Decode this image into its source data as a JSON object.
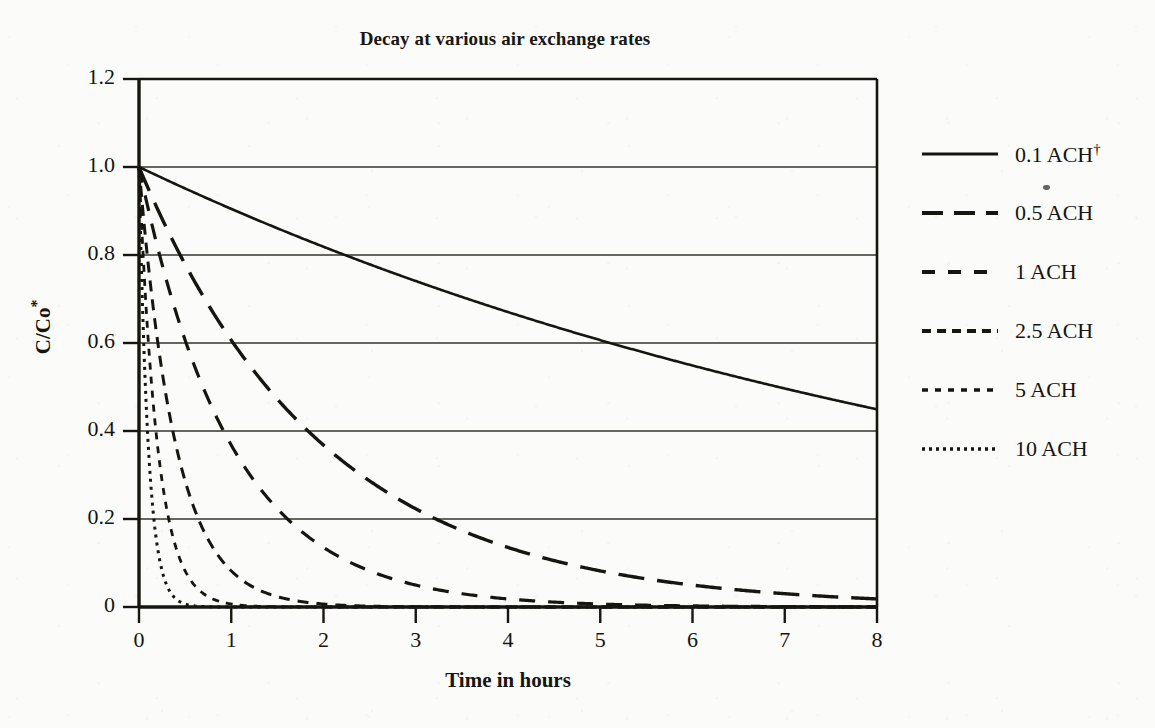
{
  "title": "Decay at various air exchange rates",
  "axes": {
    "y_title": "C/Co",
    "y_title_sup": "*",
    "x_title": "Time in hours",
    "y_ticks": [
      "1.2",
      "1.0",
      "0.8",
      "0.6",
      "0.4",
      "0.2",
      "0"
    ],
    "x_ticks": [
      "0",
      "1",
      "2",
      "3",
      "4",
      "5",
      "6",
      "7",
      "8"
    ]
  },
  "legend": {
    "items": [
      {
        "label": "0.1 ACH",
        "sup": "†",
        "dash": "none"
      },
      {
        "label": "0.5 ACH",
        "sup": "",
        "dash": "long"
      },
      {
        "label": "1 ACH",
        "sup": "",
        "dash": "medium"
      },
      {
        "label": "2.5 ACH",
        "sup": "",
        "dash": "short"
      },
      {
        "label": "5 ACH",
        "sup": "",
        "dash": "fine"
      },
      {
        "label": "10 ACH",
        "sup": "",
        "dash": "dotted"
      }
    ]
  },
  "chart_data": {
    "type": "line",
    "title": "Decay at various air exchange rates",
    "xlabel": "Time in hours",
    "ylabel": "C/Co*",
    "xlim": [
      0,
      8
    ],
    "ylim": [
      0,
      1.2
    ],
    "xticks": [
      0,
      1,
      2,
      3,
      4,
      5,
      6,
      7,
      8
    ],
    "yticks": [
      0,
      0.2,
      0.4,
      0.6,
      0.8,
      1.0,
      1.2
    ],
    "grid": "horizontal",
    "legend_position": "right",
    "model": "C/Co = exp(-ACH * t)",
    "x": [
      0,
      0.25,
      0.5,
      0.75,
      1,
      1.5,
      2,
      2.5,
      3,
      3.5,
      4,
      4.5,
      5,
      5.5,
      6,
      6.5,
      7,
      7.5,
      8
    ],
    "series": [
      {
        "name": "0.1 ACH",
        "ach": 0.1,
        "style": "solid",
        "values": [
          1.0,
          0.975,
          0.951,
          0.928,
          0.905,
          0.861,
          0.819,
          0.779,
          0.741,
          0.705,
          0.67,
          0.638,
          0.607,
          0.577,
          0.549,
          0.522,
          0.497,
          0.472,
          0.449
        ]
      },
      {
        "name": "0.5 ACH",
        "ach": 0.5,
        "style": "long-dash",
        "values": [
          1.0,
          0.882,
          0.779,
          0.687,
          0.607,
          0.472,
          0.368,
          0.287,
          0.223,
          0.174,
          0.135,
          0.105,
          0.082,
          0.064,
          0.05,
          0.039,
          0.03,
          0.024,
          0.018
        ]
      },
      {
        "name": "1 ACH",
        "ach": 1,
        "style": "medium-dash",
        "values": [
          1.0,
          0.779,
          0.607,
          0.472,
          0.368,
          0.223,
          0.135,
          0.082,
          0.05,
          0.03,
          0.018,
          0.011,
          0.007,
          0.004,
          0.002,
          0.0015,
          0.0009,
          0.0006,
          0.0003
        ]
      },
      {
        "name": "2.5 ACH",
        "ach": 2.5,
        "style": "short-dash",
        "values": [
          1.0,
          0.535,
          0.287,
          0.153,
          0.082,
          0.024,
          0.007,
          0.002,
          0.0006,
          0.0002,
          5e-05,
          1e-05,
          4e-06,
          1e-06,
          0.0,
          0.0,
          0.0,
          0.0,
          0.0
        ]
      },
      {
        "name": "5 ACH",
        "ach": 5,
        "style": "fine-dash",
        "values": [
          1.0,
          0.287,
          0.082,
          0.024,
          0.007,
          0.0006,
          5e-05,
          4e-06,
          0.0,
          0.0,
          0.0,
          0.0,
          0.0,
          0.0,
          0.0,
          0.0,
          0.0,
          0.0,
          0.0
        ]
      },
      {
        "name": "10 ACH",
        "ach": 10,
        "style": "dotted",
        "values": [
          1.0,
          0.082,
          0.007,
          0.0006,
          5e-05,
          0.0,
          0.0,
          0.0,
          0.0,
          0.0,
          0.0,
          0.0,
          0.0,
          0.0,
          0.0,
          0.0,
          0.0,
          0.0,
          0.0
        ]
      }
    ]
  },
  "colors": {
    "ink": "#16150f",
    "paper": "#fbfbf9",
    "gridline": "#34332d"
  }
}
